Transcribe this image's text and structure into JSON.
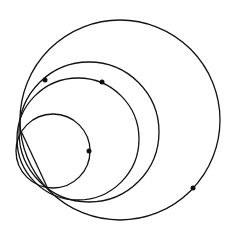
{
  "diagram": {
    "type": "geometric-circles",
    "background": "#ffffff",
    "stroke_color": "#111111",
    "stroke_width": 1.3,
    "circles": [
      {
        "name": "large-circle",
        "cx": 120,
        "cy": 120,
        "r": 100
      },
      {
        "name": "medium-large-circle",
        "cx": 89,
        "cy": 132,
        "r": 70
      },
      {
        "name": "medium-circle",
        "cx": 78,
        "cy": 139,
        "r": 61
      },
      {
        "name": "small-circle",
        "cx": 53,
        "cy": 151,
        "r": 37
      }
    ],
    "intersection_points": [
      {
        "x": 21,
        "y": 131
      },
      {
        "x": 48,
        "y": 189
      }
    ],
    "chords": [
      {
        "x1": 21,
        "y1": 131,
        "x2": 48,
        "y2": 189
      }
    ],
    "dots": [
      {
        "name": "dot-on-medium-large-circle",
        "x": 45,
        "y": 80
      },
      {
        "name": "dot-on-medium-circle",
        "x": 102,
        "y": 82
      },
      {
        "name": "dot-on-small-circle",
        "x": 89,
        "y": 151
      },
      {
        "name": "dot-on-large-circle",
        "x": 193,
        "y": 188
      }
    ],
    "dot_radius": 2.5
  }
}
